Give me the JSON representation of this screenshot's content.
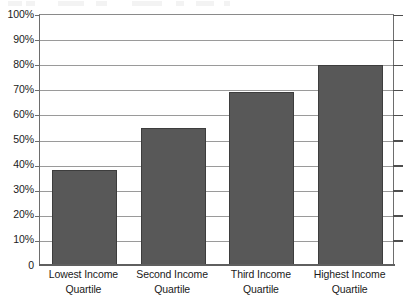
{
  "chart_data": {
    "type": "bar",
    "title": "",
    "subtitle": "",
    "xlabel": "",
    "ylabel": "",
    "categories": [
      "Lowest Income Quartile",
      "Second Income Quartile",
      "Third Income Quartile",
      "Highest Income Quartile"
    ],
    "category_lines": [
      [
        "Lowest Income",
        "Quartile"
      ],
      [
        "Second Income",
        "Quartile"
      ],
      [
        "Third Income",
        "Quartile"
      ],
      [
        "Highest Income",
        "Quartile"
      ]
    ],
    "values": [
      38,
      54.5,
      69,
      79.5
    ],
    "ylim": [
      0,
      100
    ],
    "ytick_values": [
      0,
      10,
      20,
      30,
      40,
      50,
      60,
      70,
      80,
      90,
      100
    ],
    "ytick_labels": [
      "0",
      "10%",
      "20%",
      "30%",
      "40%",
      "50%",
      "60%",
      "70%",
      "80%",
      "90%",
      "100%"
    ],
    "grid": true,
    "legend": false,
    "legend_position": "none",
    "colors": {
      "bar_fill": "#585858",
      "bar_border": "#3d3d3d",
      "gridline": "#9a9a9a",
      "axis": "#5f5f5f",
      "text": "#1a1a1a",
      "background": "#ffffff"
    }
  }
}
